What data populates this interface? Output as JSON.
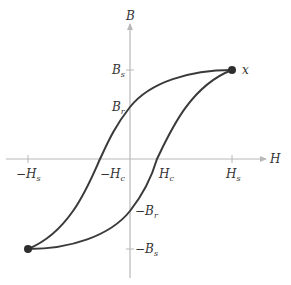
{
  "diagram": {
    "axes": {
      "x_label": "H",
      "y_label": "B"
    },
    "x_ticks": [
      {
        "main": "−H",
        "sub": "s",
        "id": "neg-Hs"
      },
      {
        "main": "−H",
        "sub": "c",
        "id": "neg-Hc"
      },
      {
        "main": "H",
        "sub": "c",
        "id": "Hc"
      },
      {
        "main": "H",
        "sub": "s",
        "id": "Hs"
      }
    ],
    "y_ticks": [
      {
        "main": "B",
        "sub": "s",
        "id": "Bs"
      },
      {
        "main": "B",
        "sub": "r",
        "id": "Br"
      },
      {
        "main": "−B",
        "sub": "r",
        "id": "neg-Br"
      },
      {
        "main": "−B",
        "sub": "s",
        "id": "neg-Bs"
      }
    ],
    "point_label": "x",
    "colors": {
      "curve": "#3a3a3a",
      "axis": "#b8b8b8",
      "text": "#333333"
    }
  }
}
